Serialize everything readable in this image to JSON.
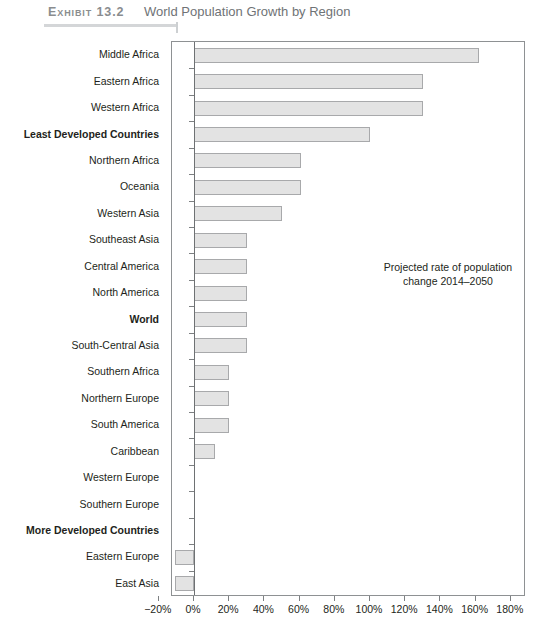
{
  "header": {
    "exhibit_label": "Exhibit 13.2",
    "title": "World Population Growth by Region"
  },
  "annotation": {
    "line1": "Projected rate of population",
    "line2": "change 2014–2050"
  },
  "bottom_note": "",
  "colors": {
    "bar_fill": "#e3e3e3",
    "bar_border": "#a8a9ab",
    "axis": "#8e9193",
    "header_gray": "#8a8d8f",
    "title_gray": "#6f7376",
    "text": "#231f20"
  },
  "chart_data": {
    "type": "bar",
    "orientation": "horizontal",
    "title": "World Population Growth by Region",
    "subtitle": "Projected rate of population change 2014–2050",
    "xlabel": "",
    "ylabel": "",
    "xlim": [
      -20,
      180
    ],
    "xtick_values": [
      -20,
      0,
      20,
      40,
      60,
      80,
      100,
      120,
      140,
      160,
      180
    ],
    "xtick_labels": [
      "−20%",
      "0%",
      "20%",
      "40%",
      "60%",
      "80%",
      "100%",
      "120%",
      "140%",
      "160%",
      "180%"
    ],
    "grid": false,
    "legend": "none",
    "categories": [
      "Middle Africa",
      "Eastern Africa",
      "Western Africa",
      "Least Developed Countries",
      "Northern Africa",
      "Oceania",
      "Western Asia",
      "Southeast Asia",
      "Central America",
      "North America",
      "World",
      "South-Central Asia",
      "Southern Africa",
      "Northern Europe",
      "South America",
      "Caribbean",
      "Western Europe",
      "Southern Europe",
      "More Developed Countries",
      "Eastern Europe",
      "East Asia"
    ],
    "values": [
      162,
      130,
      130,
      100,
      61,
      61,
      50,
      30,
      30,
      30,
      30,
      30,
      20,
      20,
      20,
      12,
      0,
      0,
      0,
      -11,
      -11
    ],
    "bold_categories": [
      "Least Developed Countries",
      "World",
      "More Developed Countries"
    ],
    "units": "percent"
  }
}
